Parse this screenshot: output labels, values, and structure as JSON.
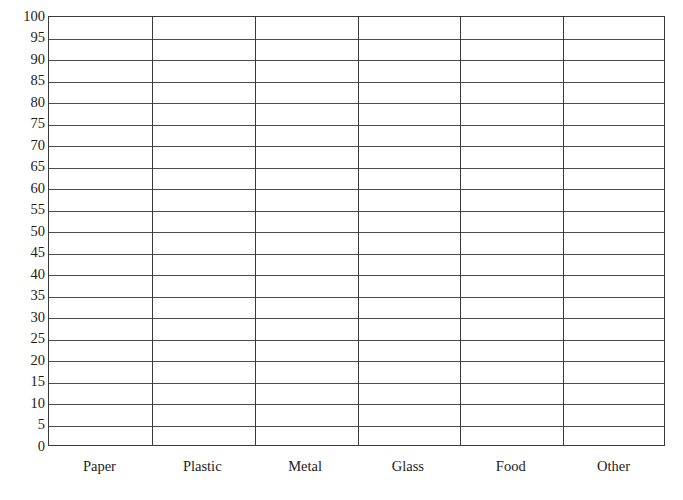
{
  "chart_data": {
    "type": "bar",
    "title": "",
    "subtitle": "",
    "xlabel": "",
    "ylabel": "",
    "categories": [
      "Paper",
      "Plastic",
      "Metal",
      "Glass",
      "Food",
      "Other"
    ],
    "values": [
      null,
      null,
      null,
      null,
      null,
      null
    ],
    "series": [],
    "ylim": [
      0,
      100
    ],
    "ytick_step": 5,
    "yticks": [
      100,
      95,
      90,
      85,
      80,
      75,
      70,
      65,
      60,
      55,
      50,
      45,
      40,
      35,
      30,
      25,
      20,
      15,
      10,
      5,
      0
    ],
    "ytick_labels": [
      "100",
      "95",
      "90",
      "85",
      "80",
      "75",
      "70",
      "65",
      "60",
      "55",
      "50",
      "45",
      "40",
      "35",
      "30",
      "25",
      "20",
      "15",
      "10",
      "5",
      "0"
    ],
    "grid": {
      "horizontal": true,
      "vertical": true,
      "note": "blank worksheet grid; no data plotted"
    },
    "legend": {
      "show": false,
      "position": "none",
      "entries": []
    },
    "annotations": [],
    "colors": {
      "background": "#ffffff",
      "frame": "#3a3a3a",
      "gridline": "#4a4a4a",
      "text": "#1c1c1c"
    }
  }
}
